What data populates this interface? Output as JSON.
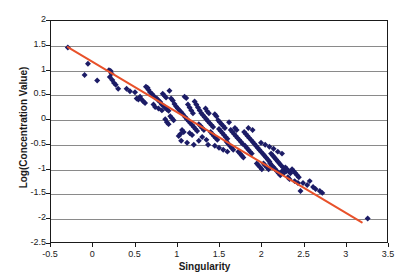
{
  "chart_data": {
    "type": "scatter",
    "title": "",
    "xlabel": "Singularity",
    "ylabel": "Log(Concentration Value)",
    "xlim": [
      -0.5,
      3.5
    ],
    "ylim": [
      -2.5,
      2.0
    ],
    "xticks": [
      "-0.5",
      "0",
      "0.5",
      "1",
      "1.5",
      "2",
      "2.5",
      "3",
      "3.5"
    ],
    "xtick_values": [
      -0.5,
      0,
      0.5,
      1,
      1.5,
      2,
      2.5,
      3,
      3.5
    ],
    "yticks": [
      "-2.5",
      "-2",
      "-1.5",
      "-1",
      "-0.5",
      "0",
      "0.5",
      "1",
      "1.5",
      "2"
    ],
    "ytick_values": [
      -2.5,
      -2,
      -1.5,
      -1,
      -0.5,
      0,
      0.5,
      1,
      1.5,
      2
    ],
    "grid": "horizontal",
    "legend": "none",
    "marker_color": "#1c1c66",
    "marker_shape": "diamond",
    "marker_size": 3,
    "trendline": {
      "color": "#e8512a",
      "width": 2,
      "x_start": -0.3,
      "y_start": 1.47,
      "x_end": 3.2,
      "y_end": -2.1,
      "slope": -1.02,
      "intercept": 1.162
    },
    "series": [
      {
        "name": "Log(Concentration Value) vs Singularity",
        "points": [
          [
            -0.3,
            1.46
          ],
          [
            -0.06,
            1.13
          ],
          [
            -0.1,
            0.9
          ],
          [
            0.05,
            0.79
          ],
          [
            0.19,
            1.0
          ],
          [
            0.21,
            0.98
          ],
          [
            0.22,
            0.93
          ],
          [
            0.2,
            0.86
          ],
          [
            0.23,
            0.8
          ],
          [
            0.25,
            0.74
          ],
          [
            0.27,
            0.7
          ],
          [
            0.3,
            0.62
          ],
          [
            0.4,
            0.62
          ],
          [
            0.44,
            0.57
          ],
          [
            0.5,
            0.55
          ],
          [
            0.52,
            0.42
          ],
          [
            0.54,
            0.4
          ],
          [
            0.56,
            0.46
          ],
          [
            0.58,
            0.4
          ],
          [
            0.6,
            0.36
          ],
          [
            0.62,
            0.33
          ],
          [
            0.63,
            0.66
          ],
          [
            0.65,
            0.64
          ],
          [
            0.66,
            0.6
          ],
          [
            0.68,
            0.55
          ],
          [
            0.7,
            0.52
          ],
          [
            0.72,
            0.48
          ],
          [
            0.74,
            0.44
          ],
          [
            0.76,
            0.42
          ],
          [
            0.78,
            0.38
          ],
          [
            0.8,
            0.35
          ],
          [
            0.82,
            0.3
          ],
          [
            0.84,
            0.27
          ],
          [
            0.86,
            0.24
          ],
          [
            0.88,
            0.2
          ],
          [
            0.9,
            0.17
          ],
          [
            0.83,
            0.52
          ],
          [
            0.85,
            0.48
          ],
          [
            0.87,
            0.44
          ],
          [
            0.91,
            0.58
          ],
          [
            0.93,
            0.42
          ],
          [
            0.95,
            0.38
          ],
          [
            0.97,
            0.31
          ],
          [
            0.99,
            0.26
          ],
          [
            1.01,
            0.22
          ],
          [
            1.03,
            0.18
          ],
          [
            1.05,
            0.14
          ],
          [
            1.07,
            0.1
          ],
          [
            0.92,
            0.06
          ],
          [
            0.94,
            0.02
          ],
          [
            0.96,
            -0.02
          ],
          [
            0.86,
            0.0
          ],
          [
            0.88,
            -0.06
          ],
          [
            0.9,
            -0.1
          ],
          [
            1.09,
            0.46
          ],
          [
            1.11,
            0.43
          ],
          [
            1.13,
            0.3
          ],
          [
            1.15,
            0.24
          ],
          [
            1.17,
            0.18
          ],
          [
            1.19,
            0.12
          ],
          [
            1.21,
            0.36
          ],
          [
            1.23,
            0.3
          ],
          [
            1.25,
            0.24
          ],
          [
            1.27,
            0.18
          ],
          [
            1.1,
            0.04
          ],
          [
            1.12,
            0.0
          ],
          [
            1.14,
            -0.04
          ],
          [
            1.16,
            -0.08
          ],
          [
            1.18,
            -0.12
          ],
          [
            1.2,
            -0.16
          ],
          [
            1.22,
            -0.2
          ],
          [
            1.24,
            -0.24
          ],
          [
            1.26,
            -0.1
          ],
          [
            1.28,
            -0.14
          ],
          [
            1.3,
            -0.18
          ],
          [
            1.32,
            -0.22
          ],
          [
            1.06,
            -0.22
          ],
          [
            1.08,
            -0.26
          ],
          [
            1.04,
            -0.3
          ],
          [
            1.02,
            -0.34
          ],
          [
            1.29,
            0.12
          ],
          [
            1.31,
            0.08
          ],
          [
            1.33,
            0.04
          ],
          [
            1.35,
            0.0
          ],
          [
            1.37,
            -0.04
          ],
          [
            1.39,
            -0.08
          ],
          [
            1.41,
            -0.12
          ],
          [
            1.43,
            -0.16
          ],
          [
            1.34,
            0.22
          ],
          [
            1.36,
            0.16
          ],
          [
            1.38,
            0.12
          ],
          [
            1.45,
            0.1
          ],
          [
            1.47,
            0.06
          ],
          [
            1.4,
            -0.26
          ],
          [
            1.42,
            -0.3
          ],
          [
            1.44,
            -0.34
          ],
          [
            1.46,
            -0.38
          ],
          [
            1.48,
            -0.42
          ],
          [
            1.5,
            -0.2
          ],
          [
            1.52,
            -0.24
          ],
          [
            1.54,
            -0.28
          ],
          [
            1.56,
            -0.32
          ],
          [
            1.58,
            -0.36
          ],
          [
            1.6,
            -0.4
          ],
          [
            1.49,
            -0.02
          ],
          [
            1.51,
            -0.06
          ],
          [
            1.53,
            -0.1
          ],
          [
            1.55,
            -0.14
          ],
          [
            1.57,
            -0.18
          ],
          [
            1.62,
            -0.06
          ],
          [
            1.64,
            -0.22
          ],
          [
            1.66,
            -0.26
          ],
          [
            1.68,
            -0.3
          ],
          [
            1.7,
            -0.34
          ],
          [
            1.72,
            -0.38
          ],
          [
            1.74,
            -0.42
          ],
          [
            1.76,
            -0.46
          ],
          [
            1.78,
            -0.5
          ],
          [
            1.59,
            -0.46
          ],
          [
            1.61,
            -0.5
          ],
          [
            1.63,
            -0.54
          ],
          [
            1.65,
            -0.58
          ],
          [
            1.67,
            -0.62
          ],
          [
            1.35,
            -0.42
          ],
          [
            1.37,
            -0.52
          ],
          [
            1.3,
            -0.36
          ],
          [
            1.26,
            -0.44
          ],
          [
            1.69,
            -0.18
          ],
          [
            1.71,
            -0.22
          ],
          [
            1.8,
            -0.26
          ],
          [
            1.82,
            -0.3
          ],
          [
            1.84,
            -0.34
          ],
          [
            1.86,
            -0.38
          ],
          [
            1.88,
            -0.42
          ],
          [
            1.9,
            -0.46
          ],
          [
            1.92,
            -0.5
          ],
          [
            1.81,
            -0.54
          ],
          [
            1.83,
            -0.58
          ],
          [
            1.85,
            -0.62
          ],
          [
            1.87,
            -0.66
          ],
          [
            1.89,
            -0.7
          ],
          [
            1.73,
            -0.66
          ],
          [
            1.75,
            -0.7
          ],
          [
            1.77,
            -0.74
          ],
          [
            1.79,
            -0.78
          ],
          [
            1.94,
            -0.54
          ],
          [
            1.96,
            -0.58
          ],
          [
            1.98,
            -0.62
          ],
          [
            2.0,
            -0.66
          ],
          [
            2.02,
            -0.7
          ],
          [
            2.04,
            -0.74
          ],
          [
            2.06,
            -0.78
          ],
          [
            2.08,
            -0.82
          ],
          [
            2.1,
            -0.86
          ],
          [
            1.95,
            -0.9
          ],
          [
            1.97,
            -0.94
          ],
          [
            1.99,
            -0.98
          ],
          [
            2.01,
            -1.02
          ],
          [
            2.03,
            -0.9
          ],
          [
            2.05,
            -0.94
          ],
          [
            2.07,
            -0.98
          ],
          [
            2.09,
            -1.02
          ],
          [
            2.12,
            -0.7
          ],
          [
            2.14,
            -0.74
          ],
          [
            2.16,
            -0.78
          ],
          [
            2.18,
            -0.82
          ],
          [
            2.11,
            -0.9
          ],
          [
            2.13,
            -0.94
          ],
          [
            2.15,
            -0.98
          ],
          [
            2.17,
            -1.02
          ],
          [
            2.19,
            -1.06
          ],
          [
            2.2,
            -0.86
          ],
          [
            2.22,
            -0.9
          ],
          [
            2.24,
            -0.94
          ],
          [
            2.26,
            -0.98
          ],
          [
            2.28,
            -1.02
          ],
          [
            2.3,
            -1.06
          ],
          [
            2.21,
            -1.1
          ],
          [
            2.23,
            -1.14
          ],
          [
            2.25,
            -1.06
          ],
          [
            2.27,
            -1.1
          ],
          [
            2.29,
            -0.98
          ],
          [
            2.31,
            -1.02
          ],
          [
            2.33,
            -1.06
          ],
          [
            2.35,
            -1.1
          ],
          [
            2.37,
            -1.02
          ],
          [
            2.39,
            -1.06
          ],
          [
            1.9,
            -0.22
          ],
          [
            1.85,
            -0.18
          ],
          [
            2.0,
            -0.48
          ],
          [
            2.05,
            -0.52
          ],
          [
            2.1,
            -0.56
          ],
          [
            2.15,
            -0.6
          ],
          [
            2.2,
            -0.66
          ],
          [
            2.25,
            -0.7
          ],
          [
            2.32,
            -1.18
          ],
          [
            2.34,
            -1.22
          ],
          [
            2.41,
            -1.1
          ],
          [
            2.43,
            -1.14
          ],
          [
            2.45,
            -1.18
          ],
          [
            2.47,
            -1.46
          ],
          [
            2.5,
            -1.3
          ],
          [
            2.55,
            -1.34
          ],
          [
            2.58,
            -1.26
          ],
          [
            2.62,
            -1.38
          ],
          [
            2.65,
            -1.42
          ],
          [
            2.7,
            -1.46
          ],
          [
            2.73,
            -1.5
          ],
          [
            2.4,
            -1.26
          ],
          [
            2.44,
            -1.3
          ],
          [
            1.45,
            -0.54
          ],
          [
            1.55,
            -0.62
          ],
          [
            1.6,
            -0.66
          ],
          [
            1.5,
            -0.58
          ],
          [
            1.15,
            -0.28
          ],
          [
            1.18,
            -0.32
          ],
          [
            0.72,
            0.3
          ],
          [
            0.74,
            0.25
          ],
          [
            0.78,
            0.22
          ],
          [
            0.82,
            0.18
          ],
          [
            1.05,
            -0.44
          ],
          [
            1.12,
            -0.48
          ],
          [
            1.2,
            -0.52
          ],
          [
            3.27,
            -2.02
          ]
        ]
      }
    ]
  },
  "axes": {
    "x_title": "Singularity",
    "y_title": "Log(Concentration Value)"
  }
}
